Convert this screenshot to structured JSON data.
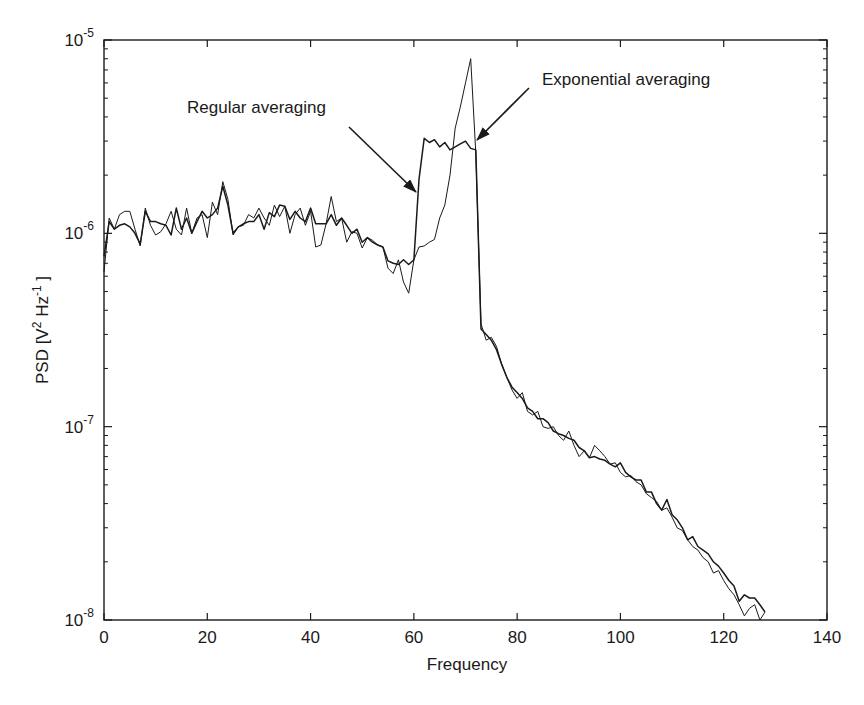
{
  "chart_data": {
    "type": "line",
    "title": "",
    "xlabel": "Frequency",
    "ylabel": "PSD [V^2 Hz^-1]",
    "xlim": [
      0,
      140
    ],
    "ylim": [
      1e-08,
      1e-05
    ],
    "yscale": "log",
    "grid": false,
    "legend": null,
    "x_ticks": [
      0,
      20,
      40,
      60,
      80,
      100,
      120,
      140
    ],
    "y_ticks": [
      "10^-8",
      "10^-7",
      "10^-6",
      "10^-5"
    ],
    "annotations": [
      {
        "text": "Regular averaging",
        "arrow_to_x": 61,
        "arrow_to_y": 1.9e-06
      },
      {
        "text": "Exponential averaging",
        "arrow_to_x": 72.5,
        "arrow_to_y": 2.9e-06
      }
    ],
    "x": [
      0,
      1,
      2,
      3,
      4,
      5,
      6,
      7,
      8,
      9,
      10,
      11,
      12,
      13,
      14,
      15,
      16,
      17,
      18,
      19,
      20,
      21,
      22,
      23,
      24,
      25,
      26,
      27,
      28,
      29,
      30,
      31,
      32,
      33,
      34,
      35,
      36,
      37,
      38,
      39,
      40,
      41,
      42,
      43,
      44,
      45,
      46,
      47,
      48,
      49,
      50,
      51,
      52,
      53,
      54,
      55,
      56,
      57,
      58,
      59,
      60,
      61,
      62,
      63,
      64,
      65,
      66,
      67,
      68,
      69,
      70,
      71,
      72,
      73,
      74,
      75,
      76,
      77,
      78,
      79,
      80,
      81,
      82,
      83,
      84,
      85,
      86,
      87,
      88,
      89,
      90,
      91,
      92,
      93,
      94,
      95,
      96,
      97,
      98,
      99,
      100,
      101,
      102,
      103,
      104,
      105,
      106,
      107,
      108,
      109,
      110,
      111,
      112,
      113,
      114,
      115,
      116,
      117,
      118,
      119,
      120,
      121,
      122,
      123,
      124,
      125,
      126,
      127,
      128
    ],
    "series": [
      {
        "name": "Regular averaging",
        "values": [
          7.6e-07,
          1.15e-06,
          1.05e-06,
          1.1e-06,
          1.12e-06,
          1.08e-06,
          1e-06,
          8.8e-07,
          1.3e-06,
          1.15e-06,
          1.15e-06,
          1.12e-06,
          1.1e-06,
          9.8e-07,
          1.35e-06,
          1.05e-06,
          1.2e-06,
          1e-06,
          1.15e-06,
          1.3e-06,
          1.2e-06,
          1.25e-06,
          1.35e-06,
          1.75e-06,
          1.4e-06,
          1e-06,
          1.08e-06,
          1.12e-06,
          1.15e-06,
          1.15e-06,
          1.25e-06,
          1.05e-06,
          1.28e-06,
          1.22e-06,
          1.4e-06,
          1.38e-06,
          1.18e-06,
          1.3e-06,
          1.2e-06,
          1.15e-06,
          1.35e-06,
          1.12e-06,
          1.12e-06,
          1.12e-06,
          1.25e-06,
          1.1e-06,
          1.2e-06,
          1.1e-06,
          1e-06,
          1.05e-06,
          9e-07,
          9.5e-07,
          9e-07,
          8.7e-07,
          8.5e-07,
          7.2e-07,
          7e-07,
          6.9e-07,
          7.3e-07,
          6.9e-07,
          7.3e-07,
          1.9e-06,
          3.1e-06,
          2.95e-06,
          3.05e-06,
          2.8e-06,
          2.95e-06,
          2.7e-06,
          2.8e-06,
          2.9e-06,
          3e-06,
          2.75e-06,
          2.7e-06,
          3.2e-07,
          3e-07,
          2.8e-07,
          2.5e-07,
          2.1e-07,
          1.8e-07,
          1.6e-07,
          1.5e-07,
          1.4e-07,
          1.25e-07,
          1.2e-07,
          1.1e-07,
          1.1e-07,
          1.05e-07,
          9.5e-08,
          9.2e-08,
          9e-08,
          8.7e-08,
          8.5e-08,
          7.8e-08,
          7.5e-08,
          6.9e-08,
          7e-08,
          6.8e-08,
          6.7e-08,
          6.4e-08,
          6.2e-08,
          6.5e-08,
          5.8e-08,
          5.5e-08,
          5.3e-08,
          5.3e-08,
          4.6e-08,
          4.6e-08,
          4e-08,
          3.7e-08,
          4.2e-08,
          3.5e-08,
          3.3e-08,
          3e-08,
          2.6e-08,
          2.7e-08,
          2.4e-08,
          2.3e-08,
          2.2e-08,
          2e-08,
          1.9e-08,
          1.75e-08,
          1.6e-08,
          1.5e-08,
          1.25e-08,
          1.35e-08,
          1.3e-08,
          1.3e-08,
          1.2e-08,
          1.1e-08
        ]
      },
      {
        "name": "Exponential averaging",
        "values": [
          6.3e-07,
          1.2e-06,
          1.05e-06,
          1.25e-06,
          1.3e-06,
          1.3e-06,
          1.05e-06,
          8.6e-07,
          1.35e-06,
          1.1e-06,
          9.8e-07,
          1.02e-06,
          1.12e-06,
          1.3e-06,
          1.05e-06,
          9.8e-07,
          1.35e-06,
          1e-06,
          1.2e-06,
          1.25e-06,
          9.5e-07,
          1.45e-06,
          1.25e-06,
          1.85e-06,
          1.5e-06,
          9.8e-07,
          1.08e-06,
          1.1e-06,
          1.25e-06,
          1.2e-06,
          1.35e-06,
          1.2e-06,
          1.1e-06,
          1.4e-06,
          1.22e-06,
          1.38e-06,
          1e-06,
          1.25e-06,
          1.35e-06,
          1.1e-06,
          1.3e-06,
          8.5e-07,
          8.7e-07,
          1.12e-06,
          1.55e-06,
          1.15e-06,
          1.2e-06,
          9e-07,
          1.02e-06,
          1e-06,
          8.4e-07,
          9.5e-07,
          9.2e-07,
          8.7e-07,
          8.5e-07,
          6.6e-07,
          6.2e-07,
          7.3e-07,
          5.6e-07,
          4.9e-07,
          7.3e-07,
          8.5e-07,
          8.6e-07,
          9e-07,
          9.3e-07,
          1.2e-06,
          1.4e-06,
          2e-06,
          3.5e-06,
          4.5e-06,
          6e-06,
          8e-06,
          2.6e-06,
          3.4e-07,
          2.8e-07,
          2.9e-07,
          2.6e-07,
          2.1e-07,
          1.8e-07,
          1.55e-07,
          1.4e-07,
          1.5e-07,
          1.2e-07,
          1.15e-07,
          1.2e-07,
          1e-07,
          9.8e-08,
          1e-07,
          9e-08,
          8.5e-08,
          9.5e-08,
          8e-08,
          7e-08,
          7.5e-08,
          6.9e-08,
          8e-08,
          7.5e-08,
          7e-08,
          6.4e-08,
          6.5e-08,
          5.8e-08,
          5.5e-08,
          5.6e-08,
          5.2e-08,
          5e-08,
          4.5e-08,
          4.3e-08,
          4.1e-08,
          3.7e-08,
          3.8e-08,
          3.4e-08,
          3e-08,
          2.9e-08,
          2.6e-08,
          2.4e-08,
          2.3e-08,
          2.1e-08,
          2e-08,
          1.75e-08,
          1.8e-08,
          1.6e-08,
          1.45e-08,
          1.35e-08,
          1.2e-08,
          1.05e-08,
          1.15e-08,
          1.2e-08,
          1e-08,
          1.1e-08
        ]
      }
    ]
  },
  "axes": {
    "x_label": "Frequency",
    "y_label_main": "PSD [V",
    "y_label_sup1": "2",
    "y_label_mid": " Hz",
    "y_label_sup2": "-1",
    "y_label_end": " ]",
    "x_tick_labels": [
      "0",
      "20",
      "40",
      "60",
      "80",
      "100",
      "120",
      "140"
    ],
    "y_tick_bases": [
      "10",
      "10",
      "10",
      "10"
    ],
    "y_tick_exps": [
      "-8",
      "-7",
      "-6",
      "-5"
    ]
  },
  "annotations": {
    "regular": "Regular averaging",
    "exponential": "Exponential averaging"
  }
}
